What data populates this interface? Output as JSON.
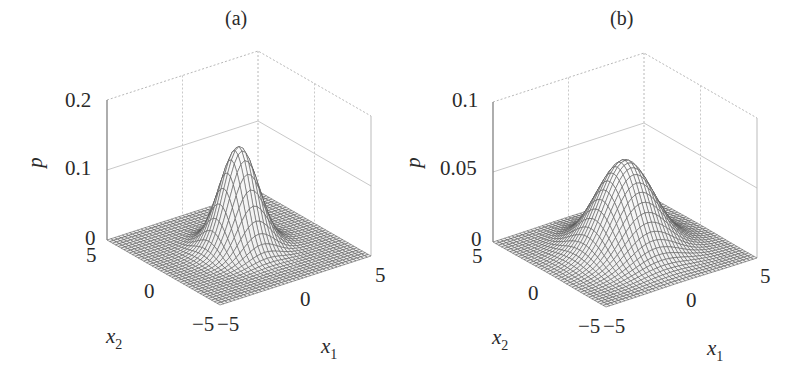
{
  "figure": {
    "panels": [
      {
        "id": "a",
        "title": "(a)",
        "zlabel": "p",
        "xlabel": "x",
        "xlabel_sub": "1",
        "ylabel": "x",
        "ylabel_sub": "2",
        "zticks": [
          "0",
          "0.1",
          "0.2"
        ],
        "x1ticks": [
          "-5",
          "0",
          "5"
        ],
        "x2ticks": [
          "-5",
          "0",
          "5"
        ]
      },
      {
        "id": "b",
        "title": "(b)",
        "zlabel": "p",
        "xlabel": "x",
        "xlabel_sub": "1",
        "ylabel": "x",
        "ylabel_sub": "2",
        "zticks": [
          "0",
          "0.05",
          "0.1"
        ],
        "x1ticks": [
          "-5",
          "0",
          "5"
        ],
        "x2ticks": [
          "-5",
          "0",
          "5"
        ]
      }
    ]
  },
  "chart_data": [
    {
      "type": "surface",
      "title": "(a)",
      "xlabel": "x1",
      "ylabel": "x2",
      "zlabel": "p",
      "xlim": [
        -5,
        5
      ],
      "ylim": [
        -5,
        5
      ],
      "zlim": [
        0,
        0.2
      ],
      "zticks": [
        0,
        0.1,
        0.2
      ],
      "xticks": [
        -5,
        0,
        5
      ],
      "yticks": [
        -5,
        0,
        5
      ],
      "grid": true,
      "function": "bivariate Gaussian density centered at (0,0), narrow",
      "peak": {
        "x1": 0,
        "x2": 0,
        "p": 0.145
      },
      "mesh_lines": 41
    },
    {
      "type": "surface",
      "title": "(b)",
      "xlabel": "x1",
      "ylabel": "x2",
      "zlabel": "p",
      "xlim": [
        -5,
        5
      ],
      "ylim": [
        -5,
        5
      ],
      "zlim": [
        0,
        0.1
      ],
      "zticks": [
        0,
        0.05,
        0.1
      ],
      "xticks": [
        -5,
        0,
        5
      ],
      "yticks": [
        -5,
        0,
        5
      ],
      "grid": true,
      "function": "bivariate Gaussian density centered at (0,0), wider",
      "peak": {
        "x1": 0,
        "x2": 0,
        "p": 0.064
      },
      "mesh_lines": 41
    }
  ]
}
